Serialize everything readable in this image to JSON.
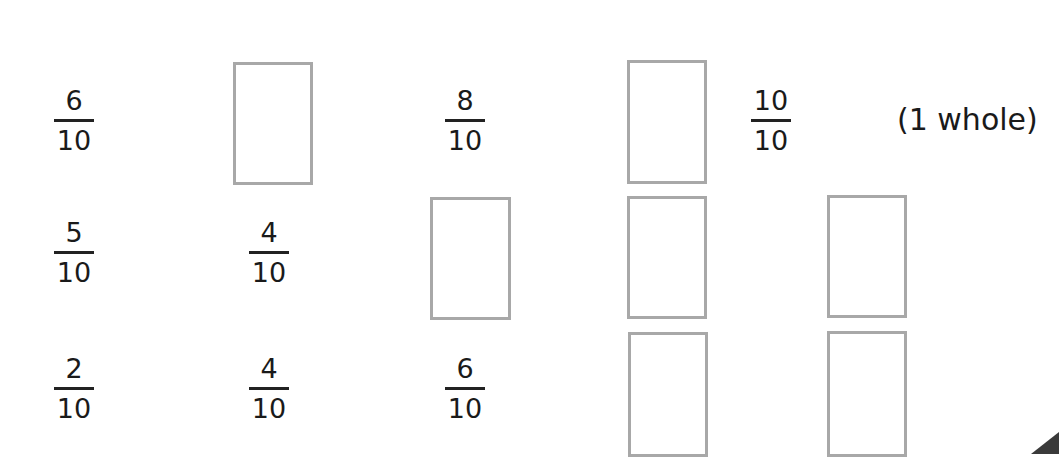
{
  "worksheet": {
    "rows": [
      {
        "items": [
          {
            "type": "fraction",
            "numerator": "6",
            "denominator": "10"
          },
          {
            "type": "blank"
          },
          {
            "type": "fraction",
            "numerator": "8",
            "denominator": "10"
          },
          {
            "type": "blank"
          },
          {
            "type": "fraction",
            "numerator": "10",
            "denominator": "10",
            "note": "(1 whole)"
          }
        ]
      },
      {
        "items": [
          {
            "type": "fraction",
            "numerator": "5",
            "denominator": "10"
          },
          {
            "type": "fraction",
            "numerator": "4",
            "denominator": "10"
          },
          {
            "type": "blank"
          },
          {
            "type": "blank"
          },
          {
            "type": "blank"
          }
        ]
      },
      {
        "items": [
          {
            "type": "fraction",
            "numerator": "2",
            "denominator": "10"
          },
          {
            "type": "fraction",
            "numerator": "4",
            "denominator": "10"
          },
          {
            "type": "fraction",
            "numerator": "6",
            "denominator": "10"
          },
          {
            "type": "blank"
          },
          {
            "type": "blank"
          }
        ]
      }
    ]
  }
}
